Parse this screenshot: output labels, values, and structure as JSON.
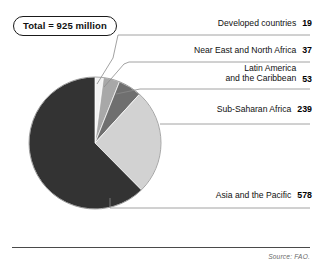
{
  "badge": {
    "label": "Total = 925 million"
  },
  "footer": {
    "source": "Source: FAO."
  },
  "callouts": [
    {
      "name": "developed",
      "line1": "Developed countries",
      "line2": "",
      "value": "19"
    },
    {
      "name": "near-east",
      "line1": "Near East and North Africa",
      "line2": "",
      "value": "37"
    },
    {
      "name": "latin",
      "line1": "Latin America",
      "line2": "and the Caribbean",
      "value": "53"
    },
    {
      "name": "sub-saharan",
      "line1": "Sub-Saharan Africa",
      "line2": "",
      "value": "239"
    },
    {
      "name": "asia",
      "line1": "Asia and the Pacific",
      "line2": "",
      "value": "578"
    }
  ],
  "chart_data": {
    "type": "pie",
    "title": "Total = 925 million",
    "unit": "million people",
    "total": 925,
    "categories": [
      "Developed countries",
      "Near East and North Africa",
      "Latin America and the Caribbean",
      "Sub-Saharan Africa",
      "Asia and the Pacific"
    ],
    "values": [
      19,
      37,
      53,
      239,
      578
    ],
    "colors": [
      "#f2f2f2",
      "#a8a8a8",
      "#6f6f6f",
      "#d2d2d2",
      "#333333"
    ],
    "slice_order_clockwise_from_top": [
      "Developed countries",
      "Near East and North Africa",
      "Latin America and the Caribbean",
      "Sub-Saharan Africa",
      "Asia and the Pacific"
    ],
    "legend": "callout-labels-right",
    "grid": false,
    "source": "Source: FAO."
  }
}
